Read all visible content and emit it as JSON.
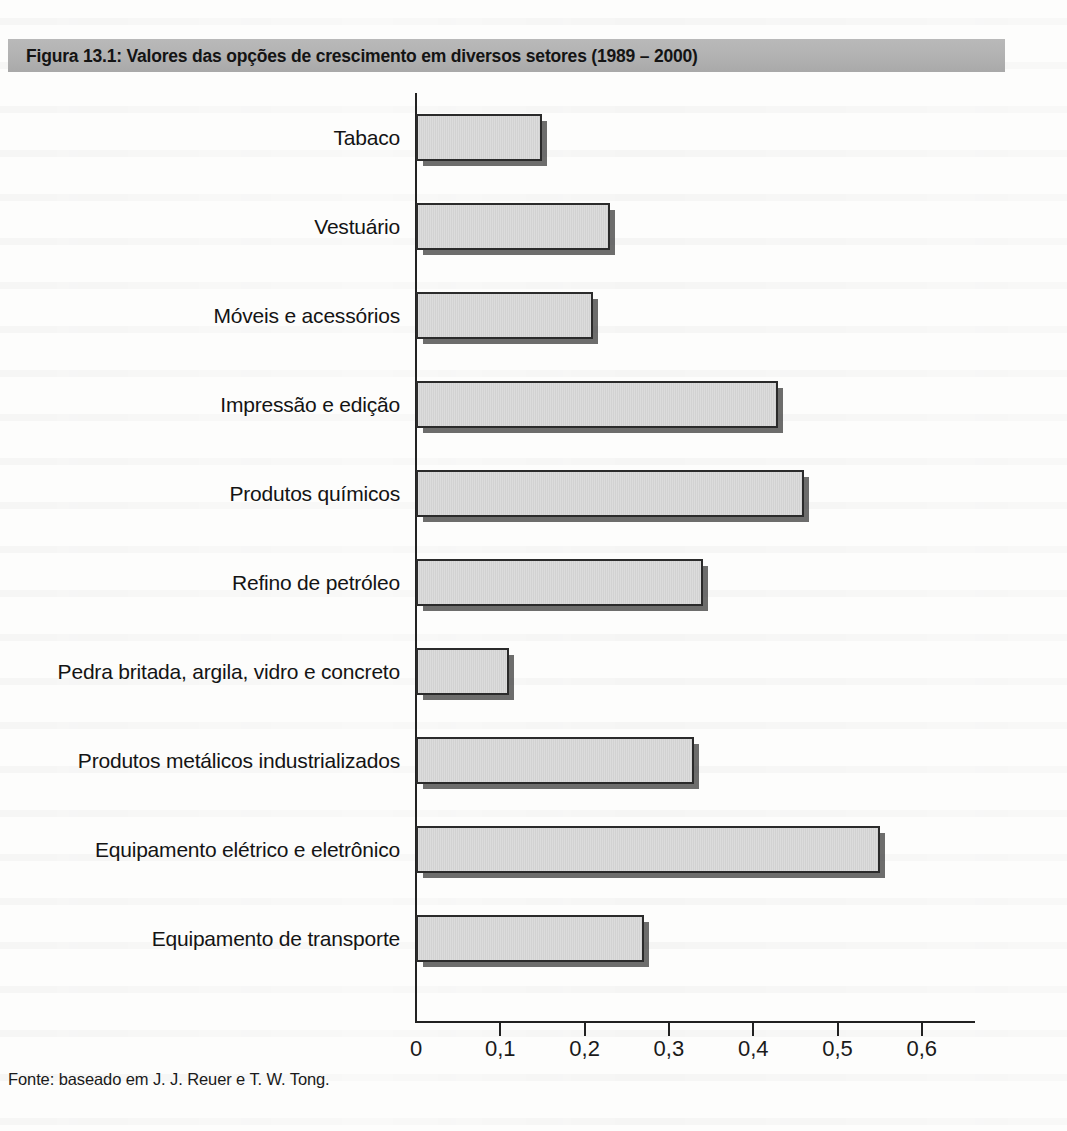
{
  "figure": {
    "title": "Figura 13.1: Valores das opções de crescimento em diversos setores (1989 – 2000)",
    "source_note": "Fonte: baseado em J. J. Reuer e T. W. Tong.",
    "title_band_color": "#b3b3b3",
    "bar_fill_color": "#d7d7d7",
    "bar_border_color": "#2b2b2b",
    "axis_color": "#222222"
  },
  "chart_data": {
    "type": "bar",
    "orientation": "horizontal",
    "title": "Figura 13.1: Valores das opções de crescimento em diversos setores (1989 – 2000)",
    "xlabel": "",
    "ylabel": "",
    "xlim": [
      0,
      0.66
    ],
    "grid": false,
    "legend": null,
    "xticks": [
      0,
      0.1,
      0.2,
      0.3,
      0.4,
      0.5,
      0.6
    ],
    "xticklabels": [
      "0",
      "0,1",
      "0,2",
      "0,3",
      "0,4",
      "0,5",
      "0,6"
    ],
    "categories": [
      "Tabaco",
      "Vestuário",
      "Móveis e acessórios",
      "Impressão e edição",
      "Produtos químicos",
      "Refino de petróleo",
      "Pedra britada, argila, vidro e concreto",
      "Produtos metálicos industrializados",
      "Equipamento elétrico e eletrônico",
      "Equipamento de transporte"
    ],
    "values": [
      0.15,
      0.23,
      0.21,
      0.43,
      0.46,
      0.34,
      0.11,
      0.33,
      0.55,
      0.27
    ]
  }
}
